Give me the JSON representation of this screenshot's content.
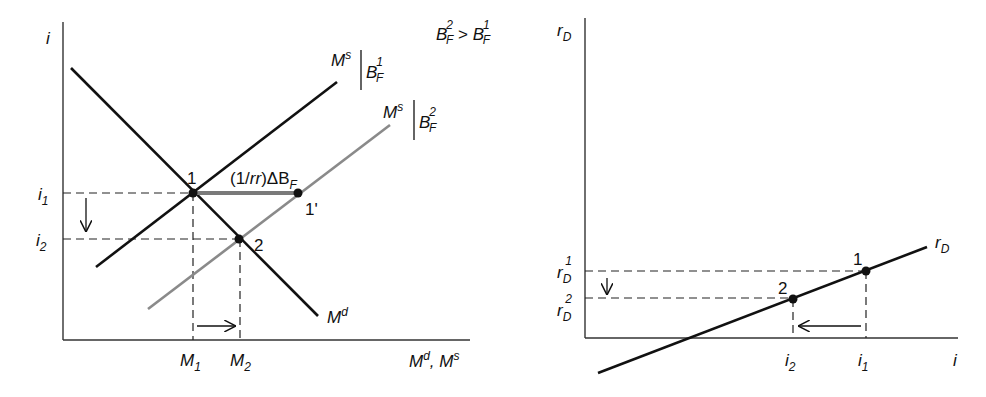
{
  "left_panel": {
    "y_axis_label": "i",
    "x_axis_label": "M",
    "x_axis_label_sup1": "d",
    "x_axis_label_mid": ", M",
    "x_axis_label_sup2": "s",
    "condition": {
      "b": "B",
      "sup2": "2",
      "sub": "F",
      "gt": " > ",
      "sup1": "1"
    },
    "curves": {
      "supply1": {
        "m": "M",
        "sup": "s",
        "b": "B",
        "bsup": "1",
        "bsub": "F"
      },
      "supply2": {
        "m": "M",
        "sup": "s",
        "b": "B",
        "bsup": "2",
        "bsub": "F"
      },
      "demand": {
        "m": "M",
        "sup": "d"
      }
    },
    "shift_label": {
      "pre": "(1/",
      "rr": "rr",
      "post": ")ΔB",
      "sub": "F"
    },
    "points": {
      "p1": "1",
      "p1prime": "1'",
      "p2": "2"
    },
    "y_ticks": {
      "i1": "i",
      "i1sub": "1",
      "i2": "i",
      "i2sub": "2"
    },
    "x_ticks": {
      "m1": "M",
      "m1sub": "1",
      "m2": "M",
      "m2sub": "2"
    },
    "colors": {
      "supply2": "#8a8a8a",
      "shift": "#7a7a7a",
      "lines": "#111111"
    }
  },
  "right_panel": {
    "y_axis_label": "r",
    "y_axis_sub": "D",
    "x_axis_label": "i",
    "curve_label": "r",
    "curve_sub": "D",
    "points": {
      "p1": "1",
      "p2": "2"
    },
    "y_ticks": {
      "r1": "r",
      "r1sub": "D",
      "r1sup": "1",
      "r2": "r",
      "r2sub": "D",
      "r2sup": "2"
    },
    "x_ticks": {
      "i2": "i",
      "i2sub": "2",
      "i1": "i",
      "i1sub": "1"
    }
  }
}
